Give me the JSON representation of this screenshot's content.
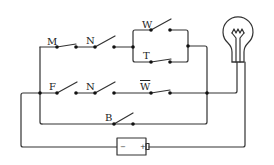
{
  "diagram": {
    "type": "circuit",
    "colors": {
      "wire": "#333333",
      "background": "#ffffff"
    },
    "switches": [
      {
        "label": "M",
        "state": "closed",
        "row": "top"
      },
      {
        "label": "N",
        "state": "open",
        "row": "top"
      },
      {
        "label": "W",
        "state": "open",
        "row": "parallel-upper"
      },
      {
        "label": "T",
        "state": "closed",
        "row": "parallel-lower"
      },
      {
        "label": "F",
        "state": "open",
        "row": "middle"
      },
      {
        "label": "N",
        "state": "open",
        "row": "middle"
      },
      {
        "label": "W",
        "overline": true,
        "state": "closed",
        "row": "middle"
      },
      {
        "label": "B",
        "state": "open",
        "row": "bottom"
      }
    ],
    "labels": {
      "m": "M",
      "n_top": "N",
      "w": "W",
      "t": "T",
      "f": "F",
      "n_mid": "N",
      "w_bar": "W",
      "b": "B"
    },
    "battery": {
      "minus": "−",
      "plus": "+"
    },
    "lamp": {
      "name": "light-bulb-icon"
    }
  }
}
